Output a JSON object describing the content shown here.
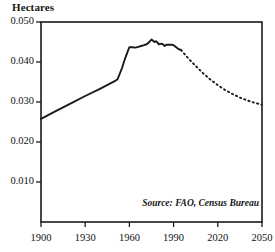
{
  "chart_data": {
    "type": "line",
    "title": "",
    "ylabel": "Hectares",
    "xlabel": "",
    "xlim": [
      1900,
      2050
    ],
    "ylim": [
      0.0,
      0.05
    ],
    "grid": false,
    "legend": null,
    "yticks": [
      "0.010",
      "0.020",
      "0.030",
      "0.040",
      "0.050"
    ],
    "ytick_values": [
      0.01,
      0.02,
      0.03,
      0.04,
      0.05
    ],
    "xticks": [
      "1900",
      "1930",
      "1960",
      "1990",
      "2020",
      "2050"
    ],
    "xtick_values": [
      1900,
      1930,
      1960,
      1990,
      2020,
      2050
    ],
    "annotation": "Source: FAO, Census Bureau",
    "series": [
      {
        "name": "historical",
        "style": "solid",
        "x": [
          1900,
          1910,
          1920,
          1930,
          1940,
          1950,
          1952,
          1955,
          1957,
          1959,
          1960,
          1962,
          1964,
          1966,
          1968,
          1970,
          1972,
          1974,
          1975,
          1976,
          1977,
          1978,
          1979,
          1980,
          1982,
          1984,
          1985,
          1987,
          1989,
          1990,
          1992,
          1993,
          1995
        ],
        "y": [
          0.0258,
          0.0277,
          0.0296,
          0.0315,
          0.0333,
          0.0352,
          0.0357,
          0.0385,
          0.0408,
          0.0428,
          0.0437,
          0.0437,
          0.0436,
          0.0438,
          0.044,
          0.0442,
          0.0445,
          0.0452,
          0.0456,
          0.0453,
          0.045,
          0.0452,
          0.0449,
          0.0444,
          0.0446,
          0.044,
          0.0443,
          0.0443,
          0.0443,
          0.0442,
          0.0436,
          0.0433,
          0.043
        ]
      },
      {
        "name": "projection",
        "style": "dashed",
        "x": [
          1995,
          2000,
          2005,
          2010,
          2015,
          2020,
          2025,
          2030,
          2035,
          2040,
          2045,
          2050
        ],
        "y": [
          0.043,
          0.0409,
          0.039,
          0.0372,
          0.0356,
          0.0342,
          0.033,
          0.032,
          0.0311,
          0.0304,
          0.0298,
          0.0293
        ]
      }
    ]
  },
  "colors": {
    "line": "#1a1a1a",
    "frame": "#1a1a1a",
    "background": "#ffffff"
  }
}
